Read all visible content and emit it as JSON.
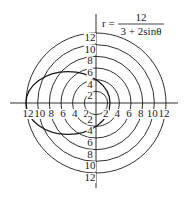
{
  "chart_data": {
    "type": "polar",
    "formula": {
      "lhs": "r =",
      "numerator": "12",
      "denominator": "3 + 2sinθ"
    },
    "grid": true,
    "rings": [
      2,
      4,
      6,
      8,
      10,
      12
    ],
    "axis_ticks": {
      "left": [
        "12",
        "10",
        "8",
        "6",
        "4",
        "2"
      ],
      "right": [
        "2",
        "4",
        "6",
        "8",
        "10",
        "12"
      ],
      "up": [
        "2",
        "4",
        "6",
        "8",
        "10",
        "12"
      ],
      "down": [
        "2",
        "4",
        "6",
        "8",
        "10",
        "12"
      ]
    },
    "curve": {
      "kind": "ellipse",
      "eccentricity": 0.6667,
      "extent_left": -12,
      "extent_right": 2.4,
      "y_intercepts": [
        4,
        -4
      ],
      "center_x": -4.8,
      "semi_major": 7.2,
      "semi_minor": 5.37
    },
    "range": [
      -12,
      12
    ]
  },
  "style": {
    "line_color": "#1a1a1a",
    "background": "#ffffff"
  }
}
